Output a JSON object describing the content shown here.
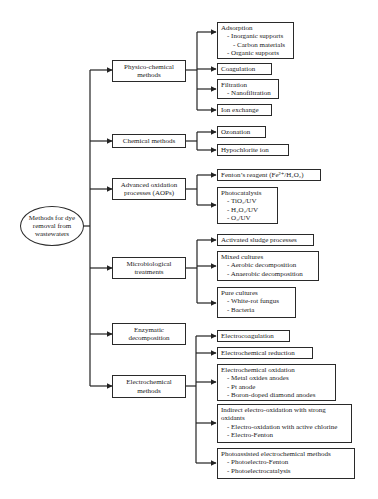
{
  "diagram": {
    "root": {
      "lines": [
        "Methods for dye",
        "removal from",
        "wastewaters"
      ]
    },
    "categories": [
      {
        "id": "physico",
        "lines": [
          "Physico-chemical",
          "methods"
        ],
        "children": [
          {
            "id": "adsorption",
            "title": "Adsorption",
            "items": [
              {
                "text": "- Inorganic supports",
                "level": 1
              },
              {
                "text": "- Carbon materials",
                "level": 2
              },
              {
                "text": "- Organic supports",
                "level": 1
              }
            ]
          },
          {
            "id": "coagulation",
            "title": "Coagulation",
            "items": []
          },
          {
            "id": "filtration",
            "title": "Filtration",
            "items": [
              {
                "text": "- Nanofiltration",
                "level": 1
              }
            ]
          },
          {
            "id": "ion-exchange",
            "title": "Ion exchange",
            "items": []
          }
        ]
      },
      {
        "id": "chemical",
        "lines": [
          "Chemical methods"
        ],
        "children": [
          {
            "id": "ozonation",
            "title": "Ozonation",
            "items": []
          },
          {
            "id": "hypochlorite",
            "title": "Hypochlorite ion",
            "items": []
          }
        ]
      },
      {
        "id": "aop",
        "lines": [
          "Advanced oxidation",
          "processes (AOPs)"
        ],
        "children": [
          {
            "id": "fenton",
            "title": "Fenton’s reagent (Fe²⁺/H₂O₂)",
            "items": []
          },
          {
            "id": "photocatalysis",
            "title": "Photocatalysis",
            "items": [
              {
                "text": "- TiO₂/UV",
                "level": 1
              },
              {
                "text": "- H₂O₂/UV",
                "level": 1
              },
              {
                "text": "- O₃/UV",
                "level": 1
              }
            ]
          }
        ]
      },
      {
        "id": "microbiological",
        "lines": [
          "Microbiological",
          "treatments"
        ],
        "children": [
          {
            "id": "activated-sludge",
            "title": "Activated sludge processes",
            "items": []
          },
          {
            "id": "mixed-cultures",
            "title": "Mixed cultures",
            "items": [
              {
                "text": "- Aerobic decomposition",
                "level": 1
              },
              {
                "text": "- Anaerobic decomposition",
                "level": 1
              }
            ]
          },
          {
            "id": "pure-cultures",
            "title": "Pure cultures",
            "items": [
              {
                "text": "- White-rot fungus",
                "level": 1
              },
              {
                "text": "- Bacteria",
                "level": 1
              }
            ]
          }
        ]
      },
      {
        "id": "enzymatic",
        "lines": [
          "Enzymatic",
          "decomposition"
        ],
        "children": []
      },
      {
        "id": "electrochemical",
        "lines": [
          "Electrochemical",
          "methods"
        ],
        "children": [
          {
            "id": "electrocoagulation",
            "title": "Electrocoagulation",
            "items": []
          },
          {
            "id": "electrochemical-reduction",
            "title": "Electrochemical reduction",
            "items": []
          },
          {
            "id": "electrochemical-oxidation",
            "title": "Electrochemical oxidation",
            "items": [
              {
                "text": "- Metal oxides anodes",
                "level": 1
              },
              {
                "text": "- Pt anode",
                "level": 1
              },
              {
                "text": "- Boron-doped diamond anodes",
                "level": 1
              }
            ]
          },
          {
            "id": "indirect-electro-oxidation",
            "title": "Indirect electro-oxidation with strong oxidants",
            "title_lines": [
              "Indirect electro-oxidation with strong",
              "oxidants"
            ],
            "items": [
              {
                "text": "- Electro-oxidation with active chlorine",
                "level": 1
              },
              {
                "text": "- Electro-Fenton",
                "level": 1
              }
            ]
          },
          {
            "id": "photoassisted",
            "title": "Photoassisted electrochemical methods",
            "items": [
              {
                "text": "- Photoelectro-Fenton",
                "level": 1
              },
              {
                "text": "- Photoelectrocatalysis",
                "level": 1
              }
            ]
          }
        ]
      }
    ]
  }
}
